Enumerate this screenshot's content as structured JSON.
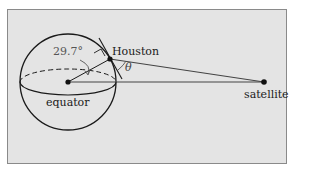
{
  "labels": {
    "city": "Houston",
    "satellite": "satellite",
    "equator": "equator",
    "latitude_angle": "29.7°",
    "elevation_angle": "θ"
  },
  "colors": {
    "background": "#e4e4e4",
    "stroke": "#1a1a1a",
    "frame_border": "#8a8a8a"
  }
}
